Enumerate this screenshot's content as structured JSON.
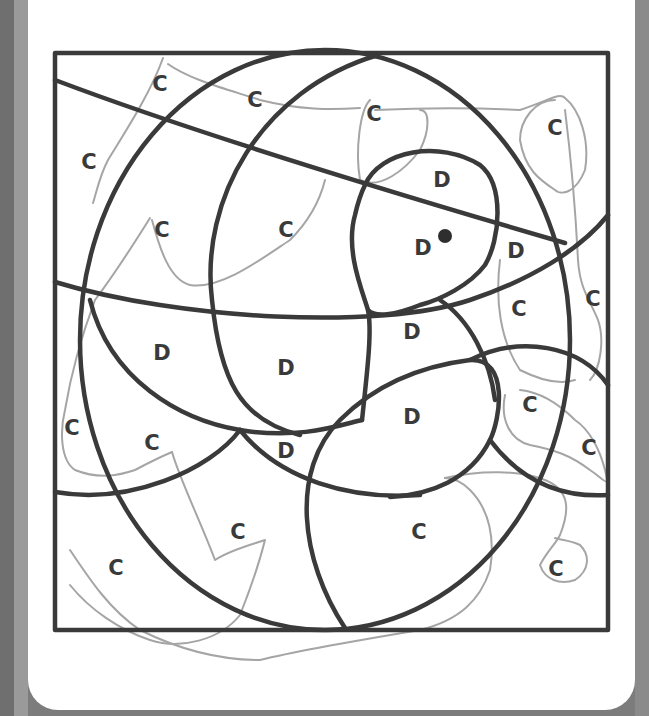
{
  "worksheet": {
    "type": "color-by-letter",
    "colors": {
      "outline": "#3a3a3a",
      "scribble": "#a5a5a5",
      "paper": "#ffffff",
      "frame": "#7c7c7c"
    },
    "labels": [
      {
        "letter": "C",
        "x": 160,
        "y": 84
      },
      {
        "letter": "C",
        "x": 255,
        "y": 100
      },
      {
        "letter": "C",
        "x": 374,
        "y": 114
      },
      {
        "letter": "C",
        "x": 555,
        "y": 128
      },
      {
        "letter": "C",
        "x": 89,
        "y": 162
      },
      {
        "letter": "D",
        "x": 442,
        "y": 180
      },
      {
        "letter": "C",
        "x": 162,
        "y": 230
      },
      {
        "letter": "C",
        "x": 286,
        "y": 230
      },
      {
        "letter": "D",
        "x": 423,
        "y": 248
      },
      {
        "letter": "D",
        "x": 516,
        "y": 251
      },
      {
        "letter": "C",
        "x": 593,
        "y": 299
      },
      {
        "letter": "C",
        "x": 519,
        "y": 309
      },
      {
        "letter": "D",
        "x": 412,
        "y": 332
      },
      {
        "letter": "D",
        "x": 162,
        "y": 353
      },
      {
        "letter": "D",
        "x": 286,
        "y": 368
      },
      {
        "letter": "C",
        "x": 530,
        "y": 405
      },
      {
        "letter": "D",
        "x": 412,
        "y": 417
      },
      {
        "letter": "C",
        "x": 72,
        "y": 428
      },
      {
        "letter": "C",
        "x": 152,
        "y": 443
      },
      {
        "letter": "D",
        "x": 286,
        "y": 451
      },
      {
        "letter": "C",
        "x": 589,
        "y": 448
      },
      {
        "letter": "C",
        "x": 238,
        "y": 532
      },
      {
        "letter": "C",
        "x": 419,
        "y": 532
      },
      {
        "letter": "C",
        "x": 116,
        "y": 568
      },
      {
        "letter": "C",
        "x": 556,
        "y": 569
      }
    ],
    "dot": {
      "x": 445,
      "y": 236
    }
  }
}
